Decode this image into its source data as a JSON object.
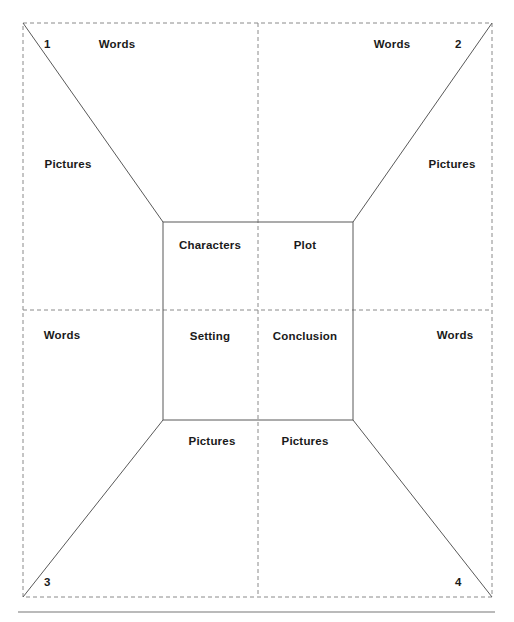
{
  "page": {
    "width": 514,
    "height": 622,
    "background": "#ffffff",
    "line_color": "#555555",
    "dash_color": "#888888",
    "text_color": "#1a1a1a"
  },
  "diagram": {
    "type": "story-planning-quadrant-template",
    "outer_frame": {
      "x1": 23,
      "y1": 23,
      "x2": 492,
      "y2": 597,
      "style": "dashed"
    },
    "inner_box": {
      "x1": 163,
      "y1": 222,
      "x2": 353,
      "y2": 420,
      "style": "solid"
    },
    "center_cross": {
      "x": 258,
      "y": 310,
      "style": "dashed"
    },
    "bottom_rule": {
      "x1": 18,
      "x2": 495,
      "y": 612,
      "style": "solid"
    }
  },
  "corner_numbers": [
    {
      "id": "quadrant-1",
      "value": "1",
      "x": 44,
      "y": 39
    },
    {
      "id": "quadrant-2",
      "value": "2",
      "x": 455,
      "y": 39
    },
    {
      "id": "quadrant-3",
      "value": "3",
      "x": 44,
      "y": 577
    },
    {
      "id": "quadrant-4",
      "value": "4",
      "x": 455,
      "y": 577
    }
  ],
  "words_labels": [
    {
      "id": "words-top-left",
      "text": "Words",
      "x": 117,
      "y": 39
    },
    {
      "id": "words-top-right",
      "text": "Words",
      "x": 392,
      "y": 39
    },
    {
      "id": "words-middle-left",
      "text": "Words",
      "x": 62,
      "y": 330
    },
    {
      "id": "words-middle-right",
      "text": "Words",
      "x": 455,
      "y": 330
    }
  ],
  "pictures_labels": [
    {
      "id": "pictures-left",
      "text": "Pictures",
      "x": 68,
      "y": 159
    },
    {
      "id": "pictures-right",
      "text": "Pictures",
      "x": 452,
      "y": 159
    },
    {
      "id": "pictures-bottom-left",
      "text": "Pictures",
      "x": 212,
      "y": 436
    },
    {
      "id": "pictures-bottom-right",
      "text": "Pictures",
      "x": 305,
      "y": 436
    }
  ],
  "inner_cells": [
    {
      "id": "cell-characters",
      "text": "Characters",
      "x": 210,
      "y": 240
    },
    {
      "id": "cell-plot",
      "text": "Plot",
      "x": 305,
      "y": 240
    },
    {
      "id": "cell-setting",
      "text": "Setting",
      "x": 210,
      "y": 331
    },
    {
      "id": "cell-conclusion",
      "text": "Conclusion",
      "x": 305,
      "y": 331
    }
  ]
}
